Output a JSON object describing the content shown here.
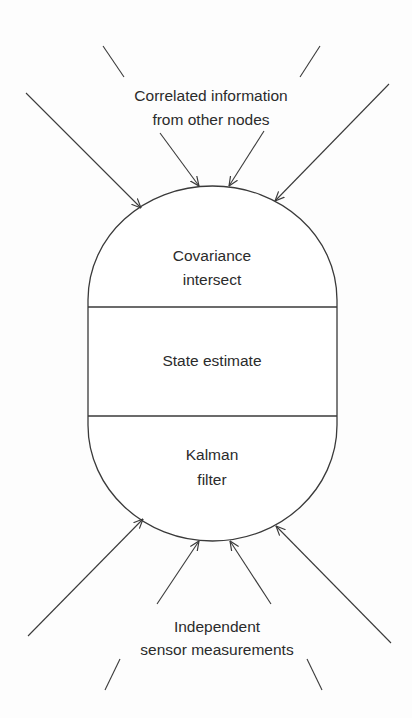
{
  "diagram": {
    "top_label": {
      "line1": "Correlated information",
      "line2": "from other nodes"
    },
    "bottom_label": {
      "line1": "Independent",
      "line2": "sensor measurements"
    },
    "node": {
      "sections": [
        {
          "line1": "Covariance",
          "line2": "intersect"
        },
        {
          "line1": "State estimate"
        },
        {
          "line1": "Kalman",
          "line2": "filter"
        }
      ]
    },
    "colors": {
      "stroke": "#3a3a3a",
      "text": "#2b2b2b",
      "background": "#fdfdfd"
    },
    "arrows": {
      "incoming_top": 4,
      "incoming_bottom": 4,
      "arrowhead_style": "open-v"
    }
  }
}
